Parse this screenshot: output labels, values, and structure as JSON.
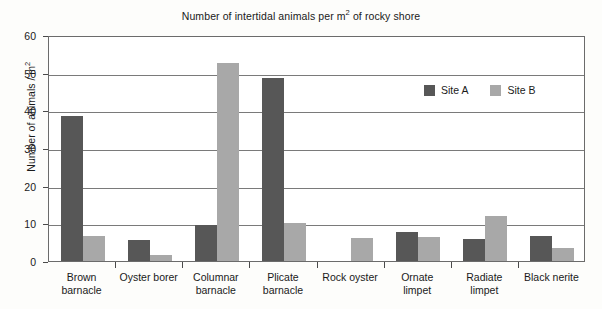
{
  "chart_data": {
    "type": "bar",
    "xlabel": "",
    "ylabel": "Number of animals / m²",
    "ylim": [
      0,
      60
    ],
    "ytick_step": 10,
    "yticks": [
      0,
      10,
      20,
      30,
      40,
      50,
      60
    ],
    "grid": true,
    "legend_position": "upper-right-inside",
    "categories": [
      "Brown barnacle",
      "Oyster borer",
      "Columnar barnacle",
      "Plicate barnacle",
      "Rock oyster",
      "Ornate limpet",
      "Radiate limpet",
      "Black nerite"
    ],
    "category_lines": [
      [
        "Brown",
        "barnacle"
      ],
      [
        "Oyster borer",
        ""
      ],
      [
        "Columnar",
        "barnacle"
      ],
      [
        "Plicate",
        "barnacle"
      ],
      [
        "Rock oyster",
        ""
      ],
      [
        "Ornate",
        "limpet"
      ],
      [
        "Radiate",
        "limpet"
      ],
      [
        "Black nerite",
        ""
      ]
    ],
    "series": [
      {
        "name": "Site A",
        "color": "#575757",
        "values": [
          38.5,
          5.6,
          9.6,
          48.5,
          0,
          7.7,
          5.8,
          6.6
        ]
      },
      {
        "name": "Site B",
        "color": "#a8a8a8",
        "values": [
          6.6,
          1.6,
          52.5,
          10.0,
          6.0,
          6.4,
          12.0,
          3.4
        ]
      }
    ]
  },
  "title_parts": {
    "before_sup": "Number of intertidal animals per m",
    "sup": "2",
    "after_sup": " of rocky shore"
  },
  "ylabel_parts": {
    "before_sup": "Number of animals / m",
    "sup": "2",
    "after_sup": ""
  },
  "ytick_labels": [
    "0",
    "10",
    "20",
    "30",
    "40",
    "50",
    "60"
  ],
  "legend": {
    "entries": [
      {
        "label": "Site A",
        "color": "#575757"
      },
      {
        "label": "Site B",
        "color": "#a8a8a8"
      }
    ]
  }
}
